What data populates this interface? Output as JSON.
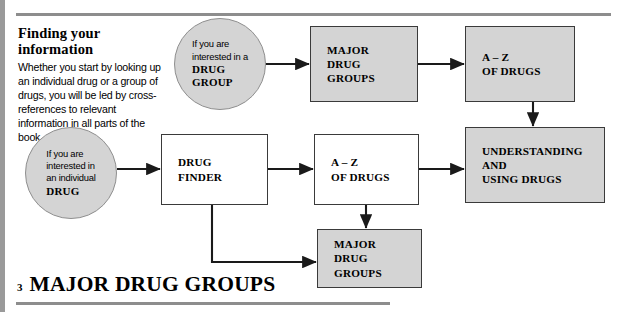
{
  "page": {
    "footer_page_number": "3",
    "footer_title": "MAJOR DRUG GROUPS"
  },
  "intro": {
    "heading": "Finding your information",
    "body": "Whether you start by looking up an individual drug or a group of drugs, you will be led by cross-references to relevant information in all parts of the book."
  },
  "colors": {
    "box_fill_gray": "#d4d4d4",
    "box_fill_white": "#ffffff",
    "box_stroke": "#3a3a3a",
    "circle_stroke": "#8f8f8f",
    "rule": "#8d8d8d",
    "edge_band": "#9a9a9a",
    "arrow": "#1a1a1a"
  },
  "flowchart": {
    "type": "flow-diagram",
    "nodes": [
      {
        "id": "circle-drug-group",
        "shape": "circle",
        "fill": "gray",
        "lead": "If you are\ninterested in a",
        "strong": "DRUG\nGROUP"
      },
      {
        "id": "circle-individual-drug",
        "shape": "circle",
        "fill": "gray",
        "lead": "If you are\ninterested in\nan individual",
        "strong": "DRUG"
      },
      {
        "id": "box-major-drug-groups-top",
        "shape": "box",
        "fill": "gray",
        "label": "MAJOR\nDRUG\nGROUPS"
      },
      {
        "id": "box-az-of-drugs-top",
        "shape": "box",
        "fill": "gray",
        "label": "A – Z\nOF DRUGS"
      },
      {
        "id": "box-drug-finder",
        "shape": "box",
        "fill": "white",
        "label": "DRUG\nFINDER"
      },
      {
        "id": "box-az-of-drugs-middle",
        "shape": "box",
        "fill": "white",
        "label": "A – Z\nOF DRUGS"
      },
      {
        "id": "box-understanding-using-drugs",
        "shape": "box",
        "fill": "gray",
        "label": "UNDERSTANDING\nAND\nUSING DRUGS"
      },
      {
        "id": "box-major-drug-groups-bottom",
        "shape": "box",
        "fill": "gray",
        "label": "MAJOR\nDRUG\nGROUPS"
      }
    ],
    "edges": [
      {
        "from": "circle-drug-group",
        "to": "box-major-drug-groups-top",
        "direction": "right"
      },
      {
        "from": "box-major-drug-groups-top",
        "to": "box-az-of-drugs-top",
        "direction": "right"
      },
      {
        "from": "box-az-of-drugs-top",
        "to": "box-understanding-using-drugs",
        "direction": "down"
      },
      {
        "from": "circle-individual-drug",
        "to": "box-drug-finder",
        "direction": "right"
      },
      {
        "from": "box-drug-finder",
        "to": "box-az-of-drugs-middle",
        "direction": "right"
      },
      {
        "from": "box-az-of-drugs-middle",
        "to": "box-understanding-using-drugs",
        "direction": "right"
      },
      {
        "from": "box-az-of-drugs-middle",
        "to": "box-major-drug-groups-bottom",
        "direction": "down"
      },
      {
        "from": "box-drug-finder",
        "to": "box-major-drug-groups-bottom",
        "direction": "down-right-elbow"
      }
    ]
  }
}
